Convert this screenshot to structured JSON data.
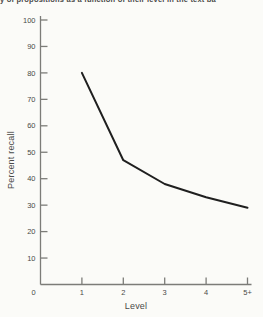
{
  "caption": "y of propositions as a function of their level in the text ba",
  "chart_data": {
    "type": "line",
    "title": "",
    "xlabel": "Level",
    "ylabel": "Percent recall",
    "categories": [
      "1",
      "2",
      "3",
      "4",
      "5+"
    ],
    "x_origin_label": "0",
    "values": [
      80,
      47,
      38,
      33,
      29
    ],
    "ylim": [
      0,
      100
    ],
    "ytick_step": 10,
    "xlim_note": "categorical levels 1 through 5+ with origin 0",
    "grid": false,
    "legend": null,
    "colors": {
      "line": "#1f1f1f",
      "axis": "#7c7c78",
      "text": "#4a4a48",
      "background": "#fbfbf8"
    }
  }
}
